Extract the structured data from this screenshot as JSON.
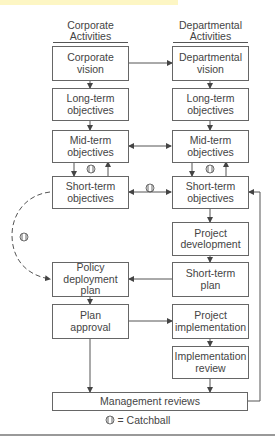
{
  "headers": {
    "left": "Corporate Activities",
    "right": "Departmental Activities"
  },
  "left_column": [
    {
      "id": "corporate-vision",
      "label": "Corporate vision"
    },
    {
      "id": "long-term-objectives",
      "label": "Long-term objectives"
    },
    {
      "id": "mid-term-objectives",
      "label": "Mid-term objectives"
    },
    {
      "id": "short-term-objectives",
      "label": "Short-term objectives"
    },
    {
      "id": "policy-deployment-plan",
      "label": "Policy deployment plan"
    },
    {
      "id": "plan-approval",
      "label": "Plan approval"
    }
  ],
  "right_column": [
    {
      "id": "departmental-vision",
      "label": "Departmental vision"
    },
    {
      "id": "long-term-objectives",
      "label": "Long-term objectives"
    },
    {
      "id": "mid-term-objectives",
      "label": "Mid-term objectives"
    },
    {
      "id": "short-term-objectives",
      "label": "Short-term objectives"
    },
    {
      "id": "project-development",
      "label": "Project development"
    },
    {
      "id": "short-term-plan",
      "label": "Short-term plan"
    },
    {
      "id": "project-implementation",
      "label": "Project implementation"
    },
    {
      "id": "implementation-review",
      "label": "Implementation review"
    }
  ],
  "bottom_box": {
    "label": "Management reviews"
  },
  "legend": {
    "symbol": "catchball-icon",
    "text": "= Catchball"
  },
  "colors": {
    "line": "#555555",
    "box_border": "#666666",
    "highlight": "#fdf6c4",
    "text": "#444444"
  }
}
